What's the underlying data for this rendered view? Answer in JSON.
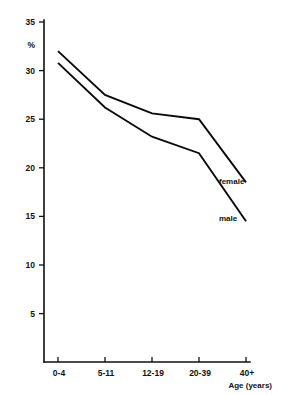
{
  "chart_data": {
    "type": "line",
    "title": "",
    "xlabel": "Age (years)",
    "ylabel": "%",
    "categories": [
      "0-4",
      "5-11",
      "12-19",
      "20-39",
      "40+"
    ],
    "ylim": [
      0,
      35
    ],
    "yticks": [
      5,
      10,
      15,
      20,
      25,
      30,
      35
    ],
    "grid": false,
    "legend_position": "inline-right",
    "series": [
      {
        "name": "female",
        "values": [
          32.0,
          27.5,
          25.6,
          25.0,
          18.5
        ]
      },
      {
        "name": "male",
        "values": [
          30.8,
          26.2,
          23.2,
          21.5,
          14.5
        ]
      }
    ]
  },
  "axes": {
    "y_unit_label": "%",
    "x_axis_title": "Age (years)",
    "y_tick_labels": [
      "35",
      "30",
      "25",
      "20",
      "15",
      "10",
      "5"
    ],
    "x_tick_labels": [
      "0-4",
      "5-11",
      "12-19",
      "20-39",
      "40+"
    ]
  },
  "series_labels": {
    "female": "female",
    "male": "male"
  },
  "colors": {
    "line": "#0a0a0a",
    "axis": "#111111",
    "background": "#ffffff"
  },
  "title_fragment": ""
}
